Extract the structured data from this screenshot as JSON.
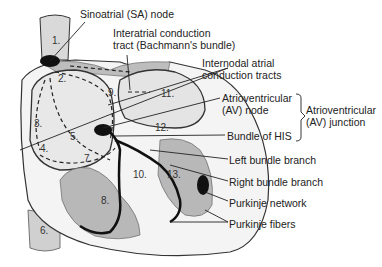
{
  "diagram": {
    "type": "anatomical-illustration",
    "labels": {
      "sa_node": "Sinoatrial (SA) node",
      "interatrial_1": "Interatrial conduction",
      "interatrial_2": "tract (Bachmann's bundle)",
      "internodal_1": "Internodal atrial",
      "internodal_2": "conduction tracts",
      "av_node_1": "Atrioventricular",
      "av_node_2": "(AV) node",
      "av_junction_1": "Atrioventricular",
      "av_junction_2": "(AV) junction",
      "bundle_his": "Bundle of HIS",
      "left_bundle": "Left bundle branch",
      "right_bundle": "Right bundle branch",
      "purkinje_network": "Purkinje network",
      "purkinje_fibers": "Purkinje fibers"
    },
    "numbers": {
      "n1": "1.",
      "n2": "2.",
      "n3": "3.",
      "n4": "4.",
      "n5": "5.",
      "n6": "6.",
      "n7": "7",
      "n8": "8.",
      "n9": "9.",
      "n10": "10.",
      "n11": "11.",
      "n12": "12.",
      "n13": "13."
    },
    "colors": {
      "outline": "#222222",
      "tissue_gray": "#c8c8c8",
      "chamber_light": "#e6e6e6",
      "node_black": "#111111"
    }
  }
}
